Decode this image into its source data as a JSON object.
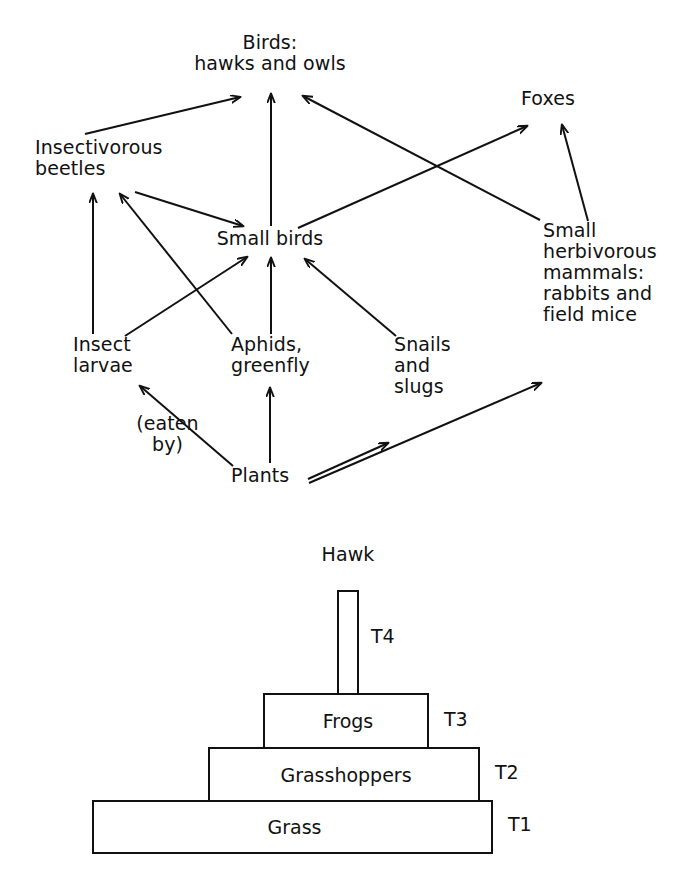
{
  "figure": {
    "title": "",
    "panels": [
      {
        "id": "food-web",
        "kind": "food-web-diagram",
        "nodes": [
          {
            "id": "birds",
            "label": "Birds:\nhawks and owls",
            "x": 270,
            "y": 40,
            "align": "center",
            "w": 220
          },
          {
            "id": "foxes",
            "label": "Foxes",
            "x": 548,
            "y": 92,
            "align": "center",
            "w": 120
          },
          {
            "id": "beetles",
            "label": "Insectivorous\nbeetles",
            "x": 35,
            "y": 141,
            "align": "left",
            "w": 200
          },
          {
            "id": "smallbirds",
            "label": "Small birds",
            "x": 270,
            "y": 232,
            "align": "center",
            "w": 160
          },
          {
            "id": "mammals",
            "label": "Small\nherbivorous\nmammals:\nrabbits and\nfield mice",
            "x": 543,
            "y": 224,
            "align": "left",
            "w": 150
          },
          {
            "id": "larvae",
            "label": "Insect\nlarvae",
            "x": 73,
            "y": 338,
            "align": "left",
            "w": 110
          },
          {
            "id": "aphids",
            "label": "Aphids,\ngreenfly",
            "x": 231,
            "y": 338,
            "align": "left",
            "w": 110
          },
          {
            "id": "snails",
            "label": "Snails\nand\nslugs",
            "x": 394,
            "y": 338,
            "align": "left",
            "w": 100
          },
          {
            "id": "eatenby",
            "label": "(eaten\nby)",
            "x": 126,
            "y": 417,
            "align": "center",
            "w": 80
          },
          {
            "id": "plants",
            "label": "Plants",
            "x": 231,
            "y": 469,
            "align": "left",
            "w": 80
          }
        ],
        "edge_caption": "(eaten by)",
        "edges": [
          {
            "from": "beetles",
            "to": "birds",
            "arrow": "beetles-to-birds"
          },
          {
            "from": "smallbirds",
            "to": "birds",
            "arrow": "smallbirds-to-birds"
          },
          {
            "from": "mammals",
            "to": "birds",
            "arrow": "mammals-to-birds"
          },
          {
            "from": "smallbirds",
            "to": "foxes",
            "arrow": "smallbirds-to-foxes"
          },
          {
            "from": "mammals",
            "to": "foxes",
            "arrow": "mammals-to-foxes"
          },
          {
            "from": "beetles",
            "to": "smallbirds",
            "arrow": "beetles-to-smallbirds"
          },
          {
            "from": "larvae",
            "to": "beetles",
            "arrow": "larvae-to-beetles"
          },
          {
            "from": "aphids",
            "to": "beetles",
            "arrow": "aphids-to-beetles"
          },
          {
            "from": "larvae",
            "to": "smallbirds",
            "arrow": "larvae-to-smallbirds"
          },
          {
            "from": "aphids",
            "to": "smallbirds",
            "arrow": "aphids-to-smallbirds"
          },
          {
            "from": "snails",
            "to": "smallbirds",
            "arrow": "snails-to-smallbirds"
          },
          {
            "from": "plants",
            "to": "larvae",
            "arrow": "plants-to-larvae"
          },
          {
            "from": "plants",
            "to": "aphids",
            "arrow": "plants-to-aphids"
          },
          {
            "from": "plants",
            "to": "snails",
            "arrow": "plants-to-snails"
          },
          {
            "from": "plants",
            "to": "mammals",
            "arrow": "plants-to-mammals"
          }
        ]
      },
      {
        "id": "trophic-pyramid",
        "kind": "trophic-pyramid",
        "apex_label": "Hawk",
        "levels": [
          {
            "tier": "T4",
            "label": "",
            "x": 337,
            "y": 590,
            "w": 22,
            "h": 104
          },
          {
            "tier": "T3",
            "label": "Frogs",
            "x": 263,
            "y": 693,
            "w": 165,
            "h": 55
          },
          {
            "tier": "T2",
            "label": "Grasshoppers",
            "x": 208,
            "y": 747,
            "w": 271,
            "h": 54
          },
          {
            "tier": "T1",
            "label": "Grass",
            "x": 92,
            "y": 800,
            "w": 400,
            "h": 53
          }
        ],
        "tier_labels": [
          {
            "text": "T4",
            "x": 371,
            "y": 628
          },
          {
            "text": "T3",
            "x": 444,
            "y": 710
          },
          {
            "text": "T2",
            "x": 495,
            "y": 763
          },
          {
            "text": "T1",
            "x": 508,
            "y": 815
          }
        ]
      }
    ]
  },
  "colors": {
    "ink": "#111111",
    "background": "#ffffff"
  }
}
